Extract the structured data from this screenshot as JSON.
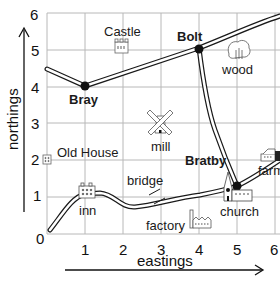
{
  "map": {
    "axes": {
      "x_title": "eastings",
      "y_title": "northings",
      "x_ticks": [
        "1",
        "2",
        "3",
        "4",
        "5",
        "6"
      ],
      "y_ticks": [
        "0",
        "1",
        "2",
        "3",
        "4",
        "5",
        "6"
      ]
    },
    "towns": [
      {
        "name": "Bray",
        "x": 1,
        "y": 4
      },
      {
        "name": "Bolt",
        "x": 4,
        "y": 5
      },
      {
        "name": "Bratby",
        "x": 5,
        "y": 2
      }
    ],
    "features": [
      {
        "name": "Castle",
        "icon": "castle-icon"
      },
      {
        "name": "wood",
        "icon": "tree-icon"
      },
      {
        "name": "mill",
        "icon": "windmill-icon"
      },
      {
        "name": "Old House",
        "icon": "house-icon"
      },
      {
        "name": "bridge",
        "icon": "bridge-icon"
      },
      {
        "name": "inn",
        "icon": "inn-icon"
      },
      {
        "name": "factory",
        "icon": "factory-icon"
      },
      {
        "name": "church",
        "icon": "church-icon"
      },
      {
        "name": "farm",
        "icon": "farm-icon"
      }
    ],
    "colors": {
      "grid": "#b5b5b5",
      "road": "#1a1a1a",
      "background": "#ffffff"
    }
  }
}
